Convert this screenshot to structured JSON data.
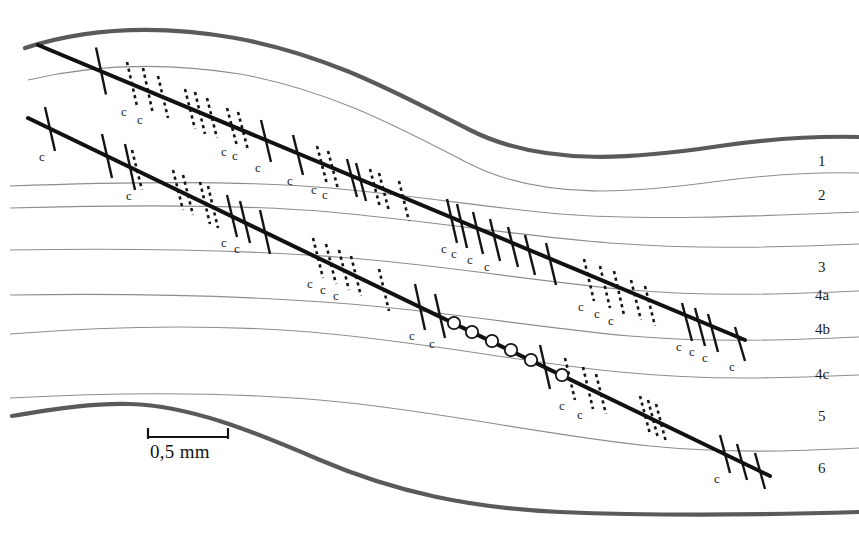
{
  "figure": {
    "kind": "geological-thin-section-sketch",
    "background": "#ffffff",
    "width": 859,
    "height": 533
  },
  "scale_bar": {
    "label": "0,5 mm",
    "x1": 148,
    "x2": 228,
    "y": 437,
    "tick_height": 9
  },
  "layer_labels": [
    {
      "text": "1",
      "x": 818,
      "y": 162
    },
    {
      "text": "2",
      "x": 818,
      "y": 196
    },
    {
      "text": "3",
      "x": 818,
      "y": 268
    },
    {
      "text": "4a",
      "x": 815,
      "y": 296
    },
    {
      "text": "4b",
      "x": 815,
      "y": 330
    },
    {
      "text": "4c",
      "x": 815,
      "y": 375
    },
    {
      "text": "5",
      "x": 818,
      "y": 417
    },
    {
      "text": "6",
      "x": 818,
      "y": 469
    }
  ],
  "boundary_curves": {
    "color": "#5a5a5a",
    "width": 4.2,
    "top": "M 25,48 C 90,27 160,25 235,38 C 330,55 400,95 470,130 C 545,168 640,158 720,146 C 775,138 820,136 859,137",
    "bottom": "M 12,416 C 60,408 95,403 130,404 C 190,406 250,430 320,460 C 395,492 470,508 560,512 C 660,516 760,515 859,512"
  },
  "thin_curves": {
    "color": "#8d8d8d",
    "width": 1.1,
    "paths": [
      "M 28,80 C 95,64 165,62 240,74 C 330,90 400,128 470,164 C 545,202 640,192 720,181 C 775,174 820,172 859,173",
      "M 10,186 C 120,182 240,180 330,188 C 420,196 490,208 560,214 C 650,221 760,216 859,212",
      "M 10,208 C 120,205 240,204 330,212 C 430,221 520,236 610,243 C 700,250 790,247 859,244",
      "M 10,250 C 130,248 250,250 350,258 C 450,266 540,282 630,290 C 710,297 790,294 859,291",
      "M 10,295 C 130,293 250,296 350,304 C 450,312 540,328 630,336 C 710,343 790,340 859,337",
      "M 10,334 C 110,326 210,324 310,332 C 420,341 520,362 620,372 C 710,381 790,378 859,375",
      "M 10,398 C 120,392 240,392 340,402 C 450,413 550,436 650,446 C 730,454 800,451 859,448"
    ]
  },
  "lines": [
    {
      "id": "upper-vein",
      "path": "M 38,45 L 745,340",
      "width": 4.0,
      "color": "#111111",
      "ticks": [
        {
          "x": 101,
          "y": 71,
          "style": "solid",
          "len": 47,
          "c": false
        },
        {
          "x": 132,
          "y": 84,
          "style": "dashed",
          "len": 44,
          "c": true
        },
        {
          "x": 148,
          "y": 91,
          "style": "dashed",
          "len": 46,
          "c": true
        },
        {
          "x": 163,
          "y": 97,
          "style": "dashed",
          "len": 42,
          "c": false
        },
        {
          "x": 190,
          "y": 109,
          "style": "dashed",
          "len": 40,
          "c": false
        },
        {
          "x": 200,
          "y": 113,
          "style": "dashed",
          "len": 42,
          "c": false
        },
        {
          "x": 212,
          "y": 118,
          "style": "dashed",
          "len": 40,
          "c": false
        },
        {
          "x": 232,
          "y": 127,
          "style": "dashed",
          "len": 38,
          "c": true
        },
        {
          "x": 243,
          "y": 131,
          "style": "dashed",
          "len": 38,
          "c": true
        },
        {
          "x": 266,
          "y": 141,
          "style": "solid",
          "len": 42,
          "c": true
        },
        {
          "x": 298,
          "y": 155,
          "style": "solid",
          "len": 40,
          "c": true
        },
        {
          "x": 322,
          "y": 165,
          "style": "dashed",
          "len": 38,
          "c": true
        },
        {
          "x": 333,
          "y": 170,
          "style": "dashed",
          "len": 38,
          "c": true
        },
        {
          "x": 352,
          "y": 178,
          "style": "solid",
          "len": 38,
          "c": false
        },
        {
          "x": 361,
          "y": 182,
          "style": "solid",
          "len": 38,
          "c": false
        },
        {
          "x": 375,
          "y": 188,
          "style": "dashed",
          "len": 38,
          "c": false
        },
        {
          "x": 384,
          "y": 192,
          "style": "dashed",
          "len": 38,
          "c": false
        },
        {
          "x": 404,
          "y": 201,
          "style": "dashed",
          "len": 40,
          "c": false
        },
        {
          "x": 452,
          "y": 221,
          "style": "solid",
          "len": 44,
          "c": true
        },
        {
          "x": 462,
          "y": 226,
          "style": "solid",
          "len": 44,
          "c": true
        },
        {
          "x": 478,
          "y": 233,
          "style": "solid",
          "len": 42,
          "c": true
        },
        {
          "x": 495,
          "y": 240,
          "style": "solid",
          "len": 42,
          "c": true
        },
        {
          "x": 513,
          "y": 247,
          "style": "solid",
          "len": 40,
          "c": false
        },
        {
          "x": 530,
          "y": 255,
          "style": "solid",
          "len": 40,
          "c": false
        },
        {
          "x": 551,
          "y": 264,
          "style": "solid",
          "len": 42,
          "c": false
        },
        {
          "x": 589,
          "y": 280,
          "style": "dashed",
          "len": 42,
          "c": true
        },
        {
          "x": 605,
          "y": 287,
          "style": "dashed",
          "len": 42,
          "c": true
        },
        {
          "x": 619,
          "y": 293,
          "style": "dashed",
          "len": 44,
          "c": true
        },
        {
          "x": 636,
          "y": 300,
          "style": "dashed",
          "len": 40,
          "c": false
        },
        {
          "x": 650,
          "y": 306,
          "style": "dashed",
          "len": 40,
          "c": false
        },
        {
          "x": 687,
          "y": 322,
          "style": "solid",
          "len": 38,
          "c": true
        },
        {
          "x": 700,
          "y": 327,
          "style": "solid",
          "len": 38,
          "c": true
        },
        {
          "x": 713,
          "y": 333,
          "style": "solid",
          "len": 38,
          "c": true
        },
        {
          "x": 740,
          "y": 344,
          "style": "solid",
          "len": 34,
          "c": true
        }
      ],
      "circles": []
    },
    {
      "id": "lower-vein",
      "path": "M 28,118 L 770,476",
      "width": 4.0,
      "color": "#111111",
      "ticks": [
        {
          "x": 50,
          "y": 129,
          "style": "solid",
          "len": 44,
          "c": true
        },
        {
          "x": 107,
          "y": 156,
          "style": "solid",
          "len": 44,
          "c": false
        },
        {
          "x": 130,
          "y": 167,
          "style": "solid",
          "len": 46,
          "c": false
        },
        {
          "x": 137,
          "y": 170,
          "style": "dashed",
          "len": 40,
          "c": true
        },
        {
          "x": 178,
          "y": 190,
          "style": "dashed",
          "len": 40,
          "c": false
        },
        {
          "x": 188,
          "y": 195,
          "style": "dashed",
          "len": 40,
          "c": false
        },
        {
          "x": 205,
          "y": 203,
          "style": "dashed",
          "len": 42,
          "c": false
        },
        {
          "x": 213,
          "y": 207,
          "style": "dashed",
          "len": 42,
          "c": false
        },
        {
          "x": 232,
          "y": 216,
          "style": "solid",
          "len": 42,
          "c": true
        },
        {
          "x": 245,
          "y": 222,
          "style": "solid",
          "len": 42,
          "c": true
        },
        {
          "x": 265,
          "y": 232,
          "style": "solid",
          "len": 44,
          "c": false
        },
        {
          "x": 318,
          "y": 258,
          "style": "dashed",
          "len": 40,
          "c": true
        },
        {
          "x": 331,
          "y": 264,
          "style": "dashed",
          "len": 40,
          "c": true
        },
        {
          "x": 344,
          "y": 270,
          "style": "dashed",
          "len": 40,
          "c": true
        },
        {
          "x": 356,
          "y": 276,
          "style": "dashed",
          "len": 40,
          "c": false
        },
        {
          "x": 384,
          "y": 290,
          "style": "dashed",
          "len": 42,
          "c": false
        },
        {
          "x": 420,
          "y": 307,
          "style": "solid",
          "len": 46,
          "c": true
        },
        {
          "x": 440,
          "y": 316,
          "style": "solid",
          "len": 44,
          "c": true
        },
        {
          "x": 545,
          "y": 367,
          "style": "solid",
          "len": 44,
          "c": false
        },
        {
          "x": 570,
          "y": 379,
          "style": "dashed",
          "len": 42,
          "c": true
        },
        {
          "x": 588,
          "y": 388,
          "style": "dashed",
          "len": 42,
          "c": true
        },
        {
          "x": 601,
          "y": 394,
          "style": "dashed",
          "len": 40,
          "c": false
        },
        {
          "x": 645,
          "y": 415,
          "style": "dashed",
          "len": 38,
          "c": false
        },
        {
          "x": 653,
          "y": 419,
          "style": "dashed",
          "len": 38,
          "c": false
        },
        {
          "x": 661,
          "y": 423,
          "style": "dashed",
          "len": 38,
          "c": false
        },
        {
          "x": 725,
          "y": 454,
          "style": "solid",
          "len": 38,
          "c": true
        },
        {
          "x": 742,
          "y": 462,
          "style": "solid",
          "len": 36,
          "c": false
        },
        {
          "x": 760,
          "y": 471,
          "style": "solid",
          "len": 36,
          "c": false
        }
      ],
      "circles": [
        {
          "x": 454,
          "y": 323
        },
        {
          "x": 472,
          "y": 332
        },
        {
          "x": 492,
          "y": 341
        },
        {
          "x": 511,
          "y": 350
        },
        {
          "x": 531,
          "y": 360
        },
        {
          "x": 562,
          "y": 375
        }
      ]
    }
  ],
  "annotation_letter": "c"
}
